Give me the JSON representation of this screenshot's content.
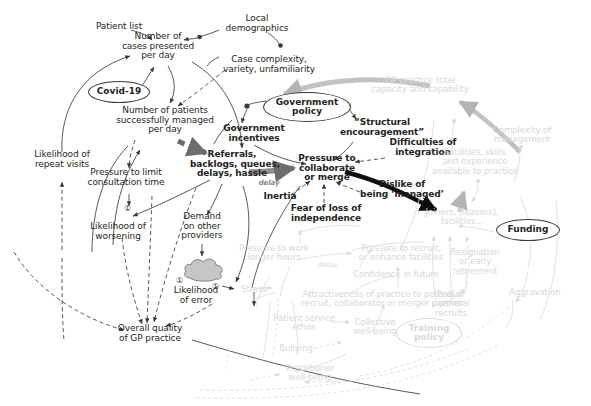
{
  "diagram": {
    "background": "#ffffff",
    "ink_dark": "#231f20",
    "ink_faded": "#d7d7da",
    "accent_gray_arrow": "#b8b8ba"
  },
  "nodes": {
    "patient_list": "Patient list",
    "local_demographics": "Local\ndemographics",
    "cases_presented": "Number of\ncases presented\nper day",
    "case_complexity": "Case complexity,\nvariety, unfamiliarity",
    "covid19": "Covid-19",
    "patients_managed": "Number of patients\nsuccessfully managed\nper day",
    "gp_total_capacity": "GP practice total\ncapacity and capability",
    "government_policy": "Government\npolicy",
    "government_incentives": "Government\nincentives",
    "structural_encouragement": "“Structural\nencouragement”",
    "difficulties_integration": "Difficulties of\nintegration",
    "complexity_management": "Complexity of\nmanagement",
    "likelihood_repeat_visits": "Likelihood of\nrepeat visits",
    "referrals_backlogs": "Referrals,\nbacklogs, queues,\ndelays, hassle",
    "pressure_collaborate": "Pressure to\ncollaborate\nor merge",
    "inertia": "Inertia",
    "fear_loss_independence": "Fear of loss of\nindependence",
    "dislike_managed": "Dislike of\nbeing ‘managed’",
    "facilities_skills": "Facilities, skills\nand experience\navailable to practice",
    "joiners_leavers": "Joiners, (leavers),\nfacilities...",
    "funding": "Funding",
    "pressure_limit_consultation": "Pressure to limit\nconsultation time",
    "demand_other_providers": "Demand\non other\nproviders",
    "likelihood_worsening": "Likelihood of\nworsening",
    "likelihood_error": "Likelihood\nof error",
    "stress": "Stress",
    "overall_quality": "Overall quality\nof GP practice",
    "pressure_work_longer": "Pressure to work\nlonger hours",
    "pressure_recruit": "Pressure to recruit,\nor enhance facilities",
    "confidence_future": "Confidence in future",
    "attractiveness_practice": "Attractiveness of practice to potential\nrecruit, collaborator or merger partner",
    "patient_service_ethos": "Patient service\nethos",
    "collective_wellbeing": "Collective\nwell-being",
    "bullying": "Bullying",
    "practitioner_wellbeing": "Practitioner\nwell-being",
    "training_policy": "Training\npolicy",
    "pool_potential_recruits": "Pool of\npotential\nrecruits",
    "resignation_early_retirement": "Resignation\nor early\nretirement",
    "aggravation": "Aggravation"
  },
  "annotations": {
    "delay_1": "delay",
    "delay_2": "delay",
    "marker_1": "①",
    "marker_2": "①",
    "marker_3": "①"
  }
}
